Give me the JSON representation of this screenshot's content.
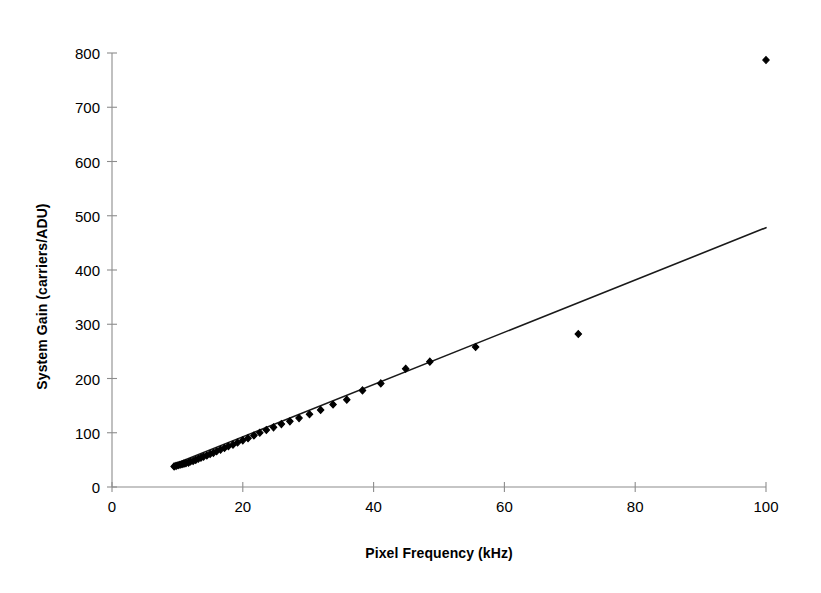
{
  "chart_data": {
    "type": "scatter",
    "title": "",
    "subtitle": "",
    "xlabel": "Pixel Frequency (kHz)",
    "ylabel": "System Gain (carriers/ADU)",
    "xlim": [
      0,
      100
    ],
    "ylim": [
      0,
      800
    ],
    "xticks": [
      0,
      20,
      40,
      60,
      80,
      100
    ],
    "yticks": [
      0,
      100,
      200,
      300,
      400,
      500,
      600,
      700,
      800
    ],
    "xtick_labels": [
      "0",
      "20",
      "40",
      "60",
      "80",
      "100"
    ],
    "ytick_labels": [
      "0",
      "100",
      "200",
      "300",
      "400",
      "500",
      "600",
      "700",
      "800"
    ],
    "grid": false,
    "legend": null,
    "legend_position": "none",
    "marker": "diamond",
    "marker_color": "#000000",
    "marker_size": 7,
    "series": [
      {
        "name": "System Gain",
        "points": [
          [
            9.5,
            38
          ],
          [
            9.8,
            39
          ],
          [
            10.1,
            40
          ],
          [
            10.4,
            41
          ],
          [
            10.7,
            42
          ],
          [
            11.0,
            43
          ],
          [
            11.3,
            44
          ],
          [
            11.7,
            45
          ],
          [
            12.0,
            47
          ],
          [
            12.4,
            48
          ],
          [
            12.8,
            50
          ],
          [
            13.2,
            52
          ],
          [
            13.6,
            54
          ],
          [
            14.0,
            56
          ],
          [
            14.5,
            58
          ],
          [
            15.0,
            61
          ],
          [
            15.5,
            63
          ],
          [
            16.0,
            66
          ],
          [
            16.6,
            69
          ],
          [
            17.2,
            72
          ],
          [
            17.8,
            75
          ],
          [
            18.5,
            78
          ],
          [
            19.2,
            82
          ],
          [
            20.0,
            86
          ],
          [
            20.8,
            90
          ],
          [
            21.7,
            95
          ],
          [
            22.6,
            100
          ],
          [
            23.6,
            105
          ],
          [
            24.7,
            110
          ],
          [
            25.9,
            116
          ],
          [
            27.2,
            121
          ],
          [
            28.6,
            127
          ],
          [
            30.2,
            134
          ],
          [
            31.9,
            142
          ],
          [
            33.8,
            152
          ],
          [
            35.9,
            161
          ],
          [
            38.3,
            178
          ],
          [
            41.1,
            191
          ],
          [
            44.9,
            218
          ],
          [
            48.6,
            231
          ],
          [
            55.6,
            258
          ],
          [
            71.3,
            282
          ],
          [
            100.0,
            787
          ]
        ]
      }
    ],
    "trendline": {
      "name": "linear fit",
      "x_start": 9.5,
      "y_start": 42,
      "x_end": 100.0,
      "y_end": 478,
      "slope": 4.82,
      "intercept": -3.8,
      "color": "#1a1a1a",
      "width": 1.6
    },
    "axis_color": "#8c8c8c",
    "background": "#ffffff"
  },
  "axes": {
    "y_title": "System Gain (carriers/ADU)",
    "x_title": "Pixel Frequency (kHz)"
  }
}
